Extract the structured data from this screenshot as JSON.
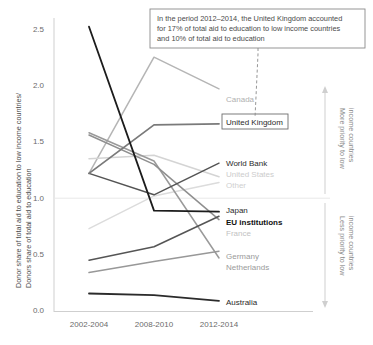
{
  "chart_data": {
    "type": "line",
    "title": "",
    "xlabel": "",
    "ylabel": "Donor share of total aid  to education to low income countries/ Donors share of total aid to education",
    "ylabel_line1": "Donor share of total aid  to education to low income countries/",
    "ylabel_line2": "Donors share of total aid to education",
    "categories": [
      "2002-2004",
      "2008-2010",
      "2012-2014"
    ],
    "ylim": [
      0.0,
      2.6
    ],
    "yticks": [
      0.0,
      0.5,
      1.0,
      1.5,
      2.0,
      2.5
    ],
    "ytick_labels": [
      "0.0",
      "0.5",
      "1.0",
      "1.5",
      "2.0",
      "2.5"
    ],
    "grid": false,
    "reference_line": {
      "value": 1.0,
      "color": "#e3e3e3"
    },
    "legend": "inline-right-labels",
    "series": [
      {
        "name": "Canada",
        "values": [
          1.22,
          2.25,
          1.97
        ],
        "color": "#b5b5b5",
        "label_color": "#b0b0b0",
        "width": 1.5
      },
      {
        "name": "United Kingdom",
        "values": [
          1.22,
          1.65,
          1.66
        ],
        "color": "#7a7a7a",
        "label_color": "#2a2a2a",
        "width": 1.8,
        "boxed_label": true
      },
      {
        "name": "World Bank",
        "values": [
          1.22,
          1.03,
          1.31
        ],
        "color": "#545454",
        "label_color": "#2a2a2a",
        "width": 1.5
      },
      {
        "name": "United States",
        "values": [
          1.35,
          1.38,
          1.19
        ],
        "color": "#d4d4d4",
        "label_color": "#cccccc",
        "width": 1.5
      },
      {
        "name": "Other",
        "values": [
          0.73,
          1.02,
          1.14
        ],
        "color": "#dcdcdc",
        "label_color": "#cfcfcf",
        "width": 1.5
      },
      {
        "name": "Japan",
        "values": [
          2.52,
          0.89,
          0.88
        ],
        "color": "#1c1c1c",
        "label_color": "#2a2a2a",
        "width": 1.8
      },
      {
        "name": "EU institutions",
        "values": [
          1.56,
          1.3,
          0.81
        ],
        "color": "#8f8f8f",
        "label_color": "#111111",
        "width": 1.5
      },
      {
        "name": "France",
        "values": [
          1.58,
          1.33,
          0.47
        ],
        "color": "#9a9a9a",
        "label_color": "#c2c2c2",
        "width": 1.5
      },
      {
        "name": "Germany",
        "values": [
          0.45,
          0.57,
          0.84
        ],
        "color": "#555555",
        "label_color": "#9a9a9a",
        "width": 1.5
      },
      {
        "name": "Netherlands",
        "values": [
          0.34,
          0.44,
          0.53
        ],
        "color": "#989898",
        "label_color": "#9a9a9a",
        "width": 1.5
      },
      {
        "name": "Australia",
        "values": [
          0.155,
          0.14,
          0.09
        ],
        "color": "#2b2b2b",
        "label_color": "#2a2a2a",
        "width": 1.8
      }
    ],
    "annotations": [
      {
        "name": "uk-callout",
        "text": "In the period 2012–2014, the United Kingdom accounted for 17% of total aid to education to low income countries and 10% of total aid to education",
        "line1": "In the period 2012–2014, the United Kingdom accounted",
        "line2": "for 17% of total aid to education to low income countries",
        "line3": "and 10% of total aid to education",
        "boxed": true
      },
      {
        "name": "more-priority",
        "text": "More priority to low income countries",
        "line1": "More priority to low",
        "line2": "income countries",
        "direction": "up"
      },
      {
        "name": "less-priority",
        "text": "Less priority to low income countries",
        "line1": "Less priority to low",
        "line2": "income countries",
        "direction": "down"
      }
    ]
  },
  "colors": {
    "axis": "#c9c9c9",
    "reference": "#e6e6e6",
    "tick_text": "#6b6b6b",
    "background": "#ffffff"
  }
}
